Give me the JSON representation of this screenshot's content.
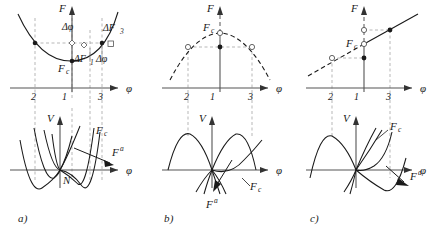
{
  "figure": {
    "panels": [
      {
        "id": "a",
        "caption": "a)",
        "top_chart": {
          "type": "line",
          "title": "",
          "xlabel": "φ",
          "ylabel": "F",
          "curve_shape": "upward parabola (convex), solid",
          "tick_labels": [
            "2",
            "1",
            "3"
          ],
          "tick_x": [
            2,
            1,
            3
          ],
          "annotations": [
            {
              "text": "F",
              "sub": "c",
              "role": "critical-force-label"
            },
            {
              "text": "Δφ",
              "role": "delta-phi-upper"
            },
            {
              "text": "ΔF",
              "sub": "3",
              "role": "delta-f3"
            },
            {
              "text": "ΔF",
              "sub": "1",
              "role": "delta-f1"
            },
            {
              "text": "Δφ",
              "role": "delta-phi-right"
            }
          ],
          "markers": [
            {
              "x": 2,
              "style": "filled-circle"
            },
            {
              "x": 1,
              "style": "open-diamond"
            },
            {
              "x": 1.35,
              "style": "open-diamond"
            },
            {
              "x": 3,
              "style": "filled-circle"
            },
            {
              "x": 3.4,
              "style": "open-square"
            },
            {
              "x": 1,
              "style": "filled-circle",
              "note": "vertex Fc"
            }
          ]
        },
        "bottom_chart": {
          "type": "line",
          "xlabel": "φ",
          "ylabel": "V",
          "curve_shape": "family of double-well potentials through origin",
          "annotations": [
            {
              "text": "F",
              "sub": "c",
              "role": "critical-curve-label"
            },
            {
              "text": "F",
              "sup": "a",
              "role": "applied-force-label"
            },
            {
              "text": "N",
              "role": "origin-label"
            }
          ]
        }
      },
      {
        "id": "b",
        "caption": "b)",
        "top_chart": {
          "type": "line",
          "xlabel": "φ",
          "ylabel": "F",
          "curve_shape": "downward parabola (concave), dashed",
          "tick_labels": [
            "2",
            "1",
            "3"
          ],
          "tick_x": [
            2,
            1,
            3
          ],
          "annotations": [
            {
              "text": "F",
              "sub": "c",
              "role": "critical-force-label"
            }
          ],
          "markers": [
            {
              "x": 1,
              "style": "open-circle",
              "note": "apex Fc"
            },
            {
              "x": 2,
              "style": "open-circle"
            },
            {
              "x": 3,
              "style": "open-circle"
            },
            {
              "x": 1,
              "style": "filled-circle"
            }
          ]
        },
        "bottom_chart": {
          "type": "line",
          "xlabel": "φ",
          "ylabel": "V",
          "curve_shape": "family of curves with two humps above axis",
          "annotations": [
            {
              "text": "F",
              "sub": "c",
              "role": "critical-curve-label"
            },
            {
              "text": "F",
              "sup": "a",
              "role": "applied-force-label"
            }
          ]
        }
      },
      {
        "id": "c",
        "caption": "c)",
        "top_chart": {
          "type": "line",
          "xlabel": "φ",
          "ylabel": "F",
          "curve_shape": "rising straight line, dashed left of φ=1, solid right",
          "tick_labels": [
            "2",
            "1",
            "3"
          ],
          "tick_x": [
            2,
            1,
            3
          ],
          "annotations": [
            {
              "text": "F",
              "sub": "c",
              "role": "critical-force-label"
            }
          ],
          "markers": [
            {
              "x": 2,
              "style": "open-circle"
            },
            {
              "x": 1,
              "style": "open-circle",
              "note": "Fc"
            },
            {
              "x": 1,
              "style": "open-circle",
              "note": "upper"
            },
            {
              "x": 1,
              "style": "filled-circle"
            },
            {
              "x": 3,
              "style": "filled-circle"
            }
          ]
        },
        "bottom_chart": {
          "type": "line",
          "xlabel": "φ",
          "ylabel": "V",
          "curve_shape": "asymmetric: hump on left, deep well on right",
          "annotations": [
            {
              "text": "F",
              "sub": "c",
              "role": "critical-curve-label"
            },
            {
              "text": "F",
              "sup": "a",
              "role": "applied-force-label"
            }
          ]
        }
      }
    ],
    "axis_labels": {
      "phi": "φ",
      "F": "F",
      "V": "V"
    },
    "colors": {
      "ink": "#1a1a1a",
      "axis": "#555555",
      "guide": "#9a9a9a",
      "background": "#ffffff"
    }
  }
}
